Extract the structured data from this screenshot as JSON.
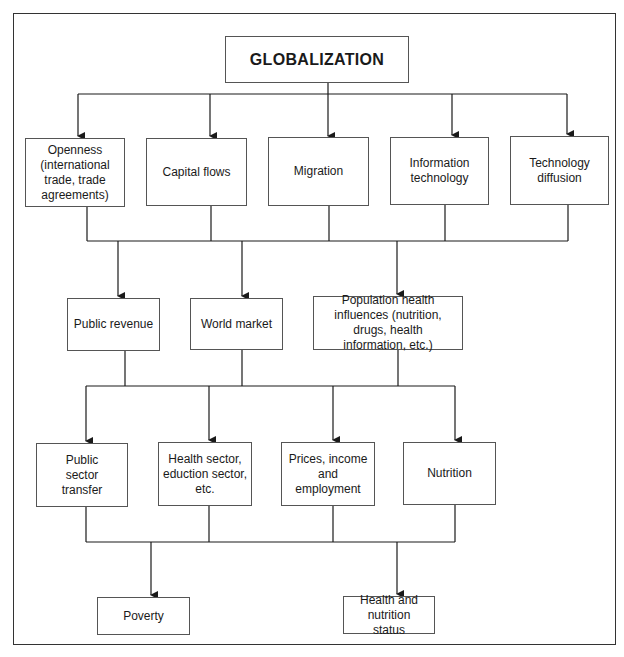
{
  "diagram": {
    "root": {
      "label": "GLOBALIZATION"
    },
    "level1": [
      {
        "label": "Openness (international trade, trade agreements)"
      },
      {
        "label": "Capital flows"
      },
      {
        "label": "Migration"
      },
      {
        "label": "Information technology"
      },
      {
        "label": "Technology diffusion"
      }
    ],
    "level2": [
      {
        "label": "Public revenue"
      },
      {
        "label": "World market"
      },
      {
        "label": "Population health influences (nutrition, drugs, health information, etc.)"
      }
    ],
    "level3": [
      {
        "label": "Public sector transfer"
      },
      {
        "label": "Health sector, eduction sector, etc."
      },
      {
        "label": "Prices, income and employment"
      },
      {
        "label": "Nutrition"
      }
    ],
    "outcomes": [
      {
        "label": "Poverty"
      },
      {
        "label": "Health and nutrition status"
      }
    ],
    "colors": {
      "line": "#1a1a1a",
      "box_border": "#555555",
      "background": "#ffffff"
    }
  }
}
